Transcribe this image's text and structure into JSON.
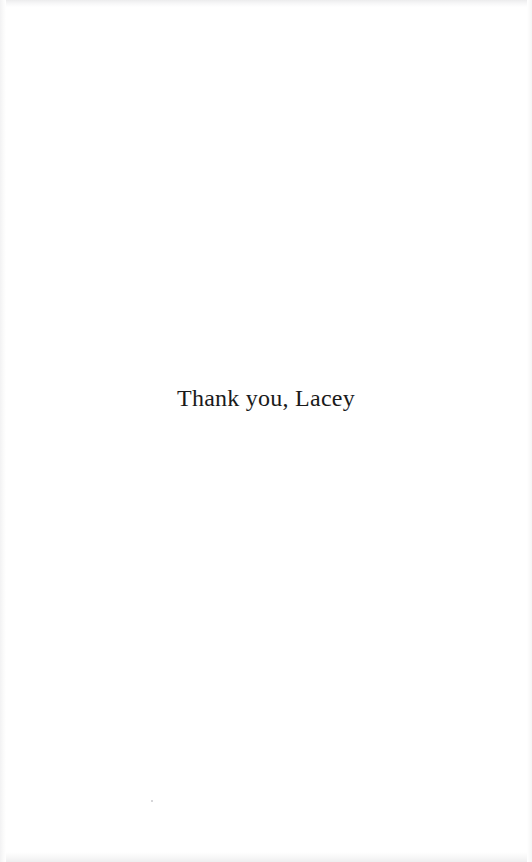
{
  "page": {
    "kind": "scanned-book-page",
    "width": 532,
    "height": 862,
    "background_color": "#ffffff",
    "text_color": "#1a1a1a"
  },
  "content": {
    "dedication_line": "Thank you, Lacey"
  },
  "artifacts": {
    "speck_color": "#c9c9cc",
    "edge_shade_color": "#ececed"
  }
}
